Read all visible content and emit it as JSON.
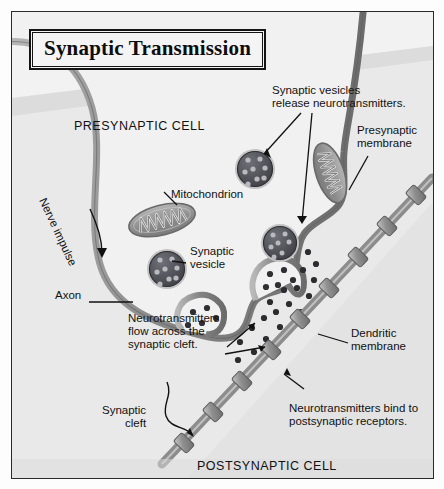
{
  "title": "Synaptic Transmission",
  "labels": {
    "presynaptic_cell": "PRESYNAPTIC CELL",
    "postsynaptic_cell": "POSTSYNAPTIC CELL",
    "vesicles_release": "Synaptic vesicles\nrelease neurotransmitters.",
    "presynaptic_membrane": "Presynaptic\nmembrane",
    "mitochondrion": "Mitochondrion",
    "synaptic_vesicle": "Synaptic\nvesicle",
    "nerve_impulse": "Nerve impulse",
    "axon": "Axon",
    "flow_across": "Neurotransmitters\nflow across the\nsynaptic cleft.",
    "dendritic_membrane": "Dendritic\nmembrane",
    "bind_receptors": "Neurotransmitters bind to\npostsynaptic receptors.",
    "synaptic_cleft": "Synaptic\ncleft"
  },
  "colors": {
    "background": "#e9e9e9",
    "cell_fill": "#f0f0f0",
    "membrane": "#8a8a8a",
    "membrane_dark": "#6e6e6e",
    "organelle": "#9a9a9a",
    "vesicle_dark": "#55555a",
    "ink": "#111111",
    "frame": "#2a2a2a"
  }
}
